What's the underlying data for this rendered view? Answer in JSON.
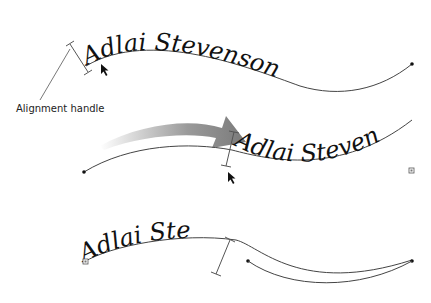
{
  "diagram": {
    "callout_label": "Alignment handle",
    "text_on_path": "Adlai Stevenson",
    "panels": [
      {
        "id": "top",
        "text": "Adlai Stevenson",
        "orientation": "normal"
      },
      {
        "id": "middle",
        "text": "Adlai Steven",
        "orientation": "normal",
        "overflow_marker": true
      },
      {
        "id": "bottom",
        "text": "Adlai Ste",
        "orientation": "flipped",
        "overflow_marker": true
      }
    ],
    "colors": {
      "ink": "#111111",
      "path": "#444444",
      "arrow_start": "#e8e8e8",
      "arrow_end": "#7a7a7a"
    }
  }
}
